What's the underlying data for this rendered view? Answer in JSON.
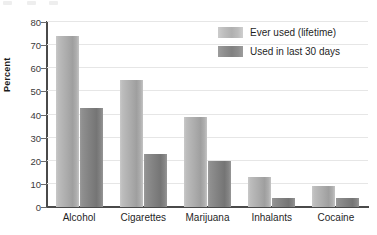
{
  "chart_data": {
    "type": "bar",
    "title": "",
    "subtitle": "",
    "xlabel": "",
    "ylabel": "Percent",
    "categories": [
      "Alcohol",
      "Cigarettes",
      "Marijuana",
      "Inhalants",
      "Cocaine"
    ],
    "series": [
      {
        "name": "Ever used (lifetime)",
        "color": "#b0b0b0",
        "values": [
          74,
          55,
          39,
          13,
          9
        ]
      },
      {
        "name": "Used in last 30 days",
        "color": "#818181",
        "values": [
          43,
          23,
          20,
          4,
          4
        ]
      }
    ],
    "ylim": [
      0,
      80
    ],
    "ytick_step": 10,
    "yticks": [
      0,
      10,
      20,
      30,
      40,
      50,
      60,
      70,
      80
    ],
    "ytick_labels": [
      "0",
      "10",
      "20",
      "30",
      "40",
      "50",
      "60",
      "70",
      "80"
    ],
    "grid": true,
    "grid_axis": "y",
    "grid_color": "#e6e6e6",
    "legend_position": "top-right",
    "axis_color": "#4a4a4a",
    "background": "#ffffff",
    "bar_style": "grouped"
  },
  "legend": {
    "items": [
      {
        "label": "Ever used (lifetime)",
        "swatch": "legend-swatch-light"
      },
      {
        "label": "Used in last 30 days",
        "swatch": "legend-swatch-dark"
      }
    ]
  },
  "axes": {
    "y_axis_title": "Percent"
  }
}
